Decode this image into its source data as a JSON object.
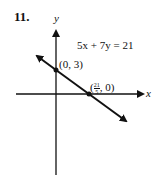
{
  "problem_number": "11.",
  "axes": {
    "x_label": "x",
    "y_label": "y"
  },
  "equation": "5x + 7y = 21",
  "points": [
    {
      "label": "(0, 3)"
    },
    {
      "label_frac_num": "21",
      "label_frac_den": "5",
      "label_rest": ", 0)",
      "label_open": "("
    }
  ]
}
